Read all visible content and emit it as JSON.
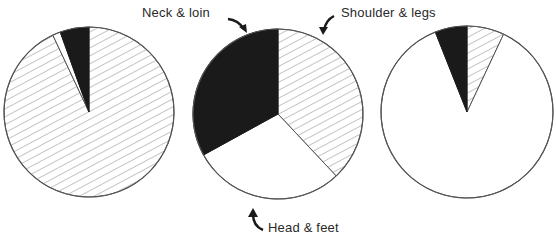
{
  "chart_data": [
    {
      "type": "pie",
      "title": "",
      "position": "left",
      "center": [
        89,
        112
      ],
      "radius": 85,
      "slices": [
        {
          "name": "Shoulder & legs",
          "fill": "hatched",
          "value": 93
        },
        {
          "name": "Head & feet",
          "fill": "white",
          "value": 1.5
        },
        {
          "name": "Neck & loin",
          "fill": "black",
          "value": 5.5
        }
      ]
    },
    {
      "type": "pie",
      "title": "",
      "position": "center",
      "center": [
        278,
        114
      ],
      "radius": 85,
      "slices": [
        {
          "name": "Shoulder & legs",
          "fill": "hatched",
          "value": 38
        },
        {
          "name": "Head & feet",
          "fill": "white",
          "value": 29
        },
        {
          "name": "Neck & loin",
          "fill": "black",
          "value": 33
        }
      ]
    },
    {
      "type": "pie",
      "title": "",
      "position": "right",
      "center": [
        467,
        112
      ],
      "radius": 86,
      "slices": [
        {
          "name": "Shoulder & legs",
          "fill": "hatched",
          "value": 7
        },
        {
          "name": "Head & feet",
          "fill": "white",
          "value": 87
        },
        {
          "name": "Neck & loin",
          "fill": "black",
          "value": 6
        }
      ]
    }
  ],
  "labels": {
    "neck_loin": "Neck & loin",
    "shoulder_legs": "Shoulder & legs",
    "head_feet": "Head & feet"
  },
  "colors": {
    "black": "#1a1a1a",
    "outline": "#555555",
    "hatch": "#8a8a8a",
    "white": "#ffffff"
  }
}
